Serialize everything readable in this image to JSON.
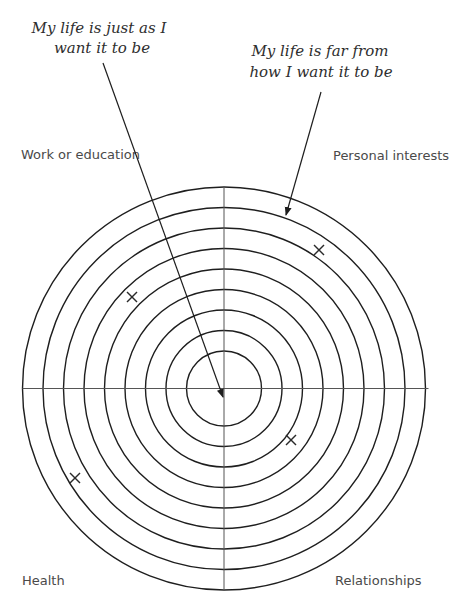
{
  "diagram": {
    "center": {
      "x": 224,
      "y": 388.5
    },
    "ring_radii": [
      201.5,
      181,
      160.5,
      140,
      119.5,
      99,
      78.5,
      58,
      37.5
    ],
    "colors": {
      "ring": "#1e1e1e",
      "axis": "#555555",
      "text_quote": "#2e2e2e",
      "text_label": "#4a4a4a"
    },
    "quotes": {
      "center_meaning": {
        "lines": [
          "My life is just as I",
          "want it to be"
        ],
        "line_positions": [
          {
            "x": 99,
            "y": 33
          },
          {
            "x": 102,
            "y": 53
          }
        ],
        "pointer": {
          "from": {
            "x": 103,
            "y": 63
          },
          "to": {
            "x": 223,
            "y": 397
          }
        }
      },
      "edge_meaning": {
        "lines": [
          "My life is far from",
          "how I want it to be"
        ],
        "line_positions": [
          {
            "x": 320,
            "y": 56
          },
          {
            "x": 321,
            "y": 77
          }
        ],
        "pointer": {
          "from": {
            "x": 321,
            "y": 92
          },
          "to": {
            "x": 286,
            "y": 215
          }
        }
      }
    },
    "sectors": [
      {
        "label": "Work or education",
        "position": "top-left",
        "x": 21,
        "y": 159
      },
      {
        "label": "Personal interests",
        "position": "top-right",
        "x": 333,
        "y": 160
      },
      {
        "label": "Health",
        "position": "bottom-left",
        "x": 22,
        "y": 585
      },
      {
        "label": "Relationships",
        "position": "bottom-right",
        "x": 335,
        "y": 585
      }
    ],
    "marks": [
      {
        "sector": "Work or education",
        "symbol": "×",
        "x": 132,
        "y": 297
      },
      {
        "sector": "Personal interests",
        "symbol": "×",
        "x": 319,
        "y": 250
      },
      {
        "sector": "Relationships",
        "symbol": "×",
        "x": 291,
        "y": 440
      },
      {
        "sector": "Health",
        "symbol": "×",
        "x": 75,
        "y": 478
      }
    ]
  }
}
